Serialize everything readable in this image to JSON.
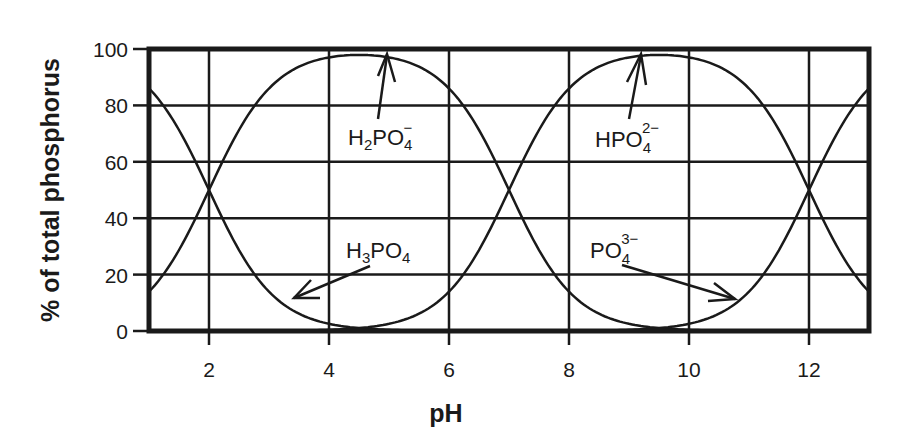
{
  "chart_data": {
    "type": "line",
    "title": "",
    "xlabel": "pH",
    "ylabel": "% of total phosphorus",
    "xlim": [
      1,
      13
    ],
    "ylim": [
      0,
      100
    ],
    "xticks": [
      2,
      4,
      6,
      8,
      10,
      12
    ],
    "yticks": [
      0,
      20,
      40,
      60,
      80,
      100
    ],
    "grid": true,
    "legend": "none (curves labeled inline with arrows)",
    "pKa": [
      2,
      7,
      12
    ],
    "x": [
      1,
      1.5,
      2,
      2.5,
      3,
      3.5,
      4,
      4.5,
      5,
      5.5,
      6,
      6.5,
      7,
      7.5,
      8,
      8.5,
      9,
      9.5,
      10,
      10.5,
      11,
      11.5,
      12,
      12.5,
      13
    ],
    "series": [
      {
        "name": "H3PO4",
        "label_main": "H",
        "label_sub1": "3",
        "label_main2": "PO",
        "label_sub2": "4",
        "label_sup": "",
        "values": [
          86,
          71,
          50,
          29,
          14,
          6,
          3,
          1,
          0,
          0,
          0,
          0,
          0,
          0,
          0,
          0,
          0,
          0,
          0,
          0,
          0,
          0,
          0,
          0,
          0
        ]
      },
      {
        "name": "H2PO4-",
        "label_main": "H",
        "label_sub1": "2",
        "label_main2": "PO",
        "label_sub2": "4",
        "label_sup": "−",
        "values": [
          14,
          29,
          50,
          71,
          86,
          93,
          96,
          97,
          96,
          93,
          86,
          71,
          50,
          29,
          14,
          6,
          3,
          1,
          0,
          0,
          0,
          0,
          0,
          0,
          0
        ]
      },
      {
        "name": "HPO4 2-",
        "label_main": "HPO",
        "label_sub1": "",
        "label_main2": "",
        "label_sub2": "4",
        "label_sup": "2−",
        "values": [
          0,
          0,
          0,
          0,
          0,
          1,
          1,
          2,
          4,
          7,
          14,
          29,
          50,
          71,
          86,
          93,
          96,
          97,
          96,
          93,
          86,
          71,
          50,
          29,
          14
        ]
      },
      {
        "name": "PO4 3-",
        "label_main": "PO",
        "label_sub1": "",
        "label_main2": "",
        "label_sub2": "4",
        "label_sup": "3−",
        "values": [
          0,
          0,
          0,
          0,
          0,
          0,
          0,
          0,
          0,
          0,
          0,
          0,
          0,
          0,
          0,
          0,
          1,
          2,
          4,
          7,
          14,
          29,
          50,
          71,
          86
        ]
      }
    ],
    "annotations": [
      {
        "text": "H2PO4−",
        "arrow_to": [
          5.0,
          100
        ]
      },
      {
        "text": "HPO4 2−",
        "arrow_to": [
          9.6,
          100
        ]
      },
      {
        "text": "H3PO4",
        "arrow_to": [
          3.4,
          6
        ]
      },
      {
        "text": "PO4 3−",
        "arrow_to": [
          10.9,
          7
        ]
      }
    ]
  },
  "axes": {
    "x_title": "pH",
    "y_title": "% of total phosphorus",
    "x_ticks": [
      "2",
      "4",
      "6",
      "8",
      "10",
      "12"
    ],
    "y_ticks": [
      "0",
      "20",
      "40",
      "60",
      "80",
      "100"
    ]
  },
  "labels": {
    "h2po4": {
      "a": "H",
      "s1": "2",
      "b": "PO",
      "s2": "4",
      "sup": "−"
    },
    "hpo4": {
      "a": "HPO",
      "s2": "4",
      "sup": "2−"
    },
    "h3po4": {
      "a": "H",
      "s1": "3",
      "b": "PO",
      "s2": "4"
    },
    "po4": {
      "a": "PO",
      "s2": "4",
      "sup": "3−"
    }
  }
}
